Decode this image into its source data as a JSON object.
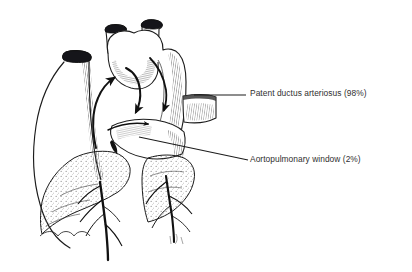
{
  "figure": {
    "style": "pen-and-ink medical illustration",
    "background_color": "#ffffff",
    "ink_color": "#1a1a1a",
    "text_color": "#2f2f2f",
    "anatomy": [
      {
        "name": "superior-vena-cava",
        "note": "large left vessel trunk with open elliptical lumen"
      },
      {
        "name": "brachiocephalic-branch-left",
        "note": "upper branch vessel with dark elliptical lumen"
      },
      {
        "name": "brachiocephalic-branch-right",
        "note": "upper branch vessel with dark elliptical lumen"
      },
      {
        "name": "aortic-arch",
        "note": "central curved arch with hatched shading"
      },
      {
        "name": "right-pulmonary-artery",
        "note": "transected vessel extending to the right"
      },
      {
        "name": "left-ventricle",
        "note": "lower left chamber"
      },
      {
        "name": "right-ventricle",
        "note": "lower right chamber"
      },
      {
        "name": "epicardial-fat",
        "note": "stippled lobulated tissue over ventricles"
      },
      {
        "name": "coronary-arteries",
        "note": "branching dark vessels on ventricular surface"
      }
    ],
    "flow_arrows": [
      {
        "name": "ascending-flow-arrow",
        "direction": "up-left"
      },
      {
        "name": "arch-descending-arrow",
        "direction": "down"
      },
      {
        "name": "ductal-shunt-arrow",
        "direction": "down-right"
      },
      {
        "name": "aortopulmonary-shunt-arrow",
        "direction": "right"
      }
    ]
  },
  "labels": {
    "pda": {
      "text": "Patent ductus arteriosus (98%)",
      "name": "patent-ductus-arteriosus",
      "percent": "98%"
    },
    "apw": {
      "text": "Aortopulmonary window (2%)",
      "name": "aortopulmonary-window",
      "percent": "2%"
    }
  }
}
